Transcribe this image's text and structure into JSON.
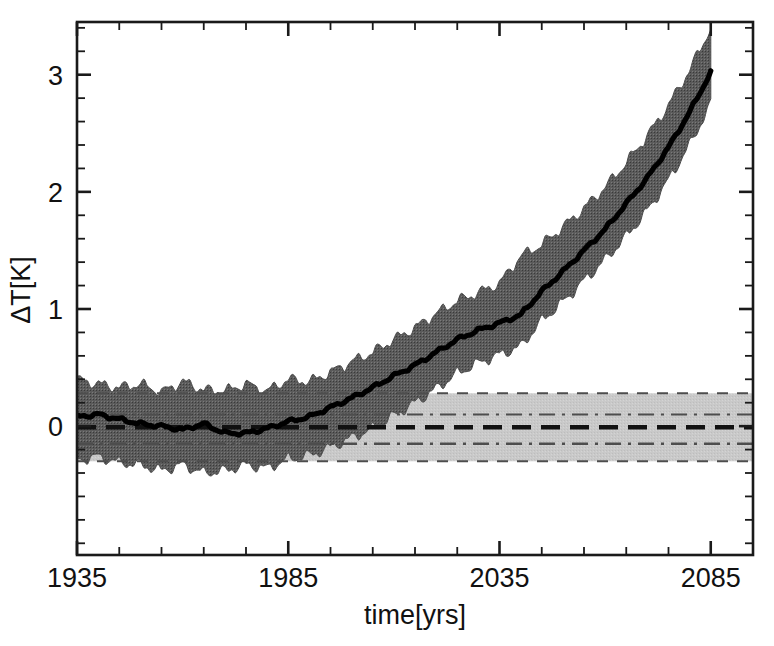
{
  "chart_data": {
    "type": "line",
    "title": "",
    "xlabel": "time[yrs]",
    "ylabel": "ΔT[K]",
    "xlim": [
      1935,
      2095
    ],
    "ylim": [
      -1.1,
      3.45
    ],
    "xticks": [
      1935,
      1985,
      2035,
      2085
    ],
    "xticklabels": [
      "1935",
      "1985",
      "2035",
      "2085"
    ],
    "yticks": [
      0,
      1,
      2,
      3
    ],
    "yticklabels": [
      "0",
      "1",
      "2",
      "3"
    ],
    "x_minor_tick_interval": 10,
    "y_minor_tick_interval": 0.2,
    "grid": false,
    "legend": null,
    "annotations": [],
    "series": [
      {
        "name": "ensemble mean ΔT",
        "style": "solid-thick-black",
        "color": "#000000",
        "x": [
          1935,
          1940,
          1945,
          1950,
          1955,
          1960,
          1965,
          1970,
          1975,
          1980,
          1985,
          1990,
          1995,
          2000,
          2005,
          2010,
          2015,
          2020,
          2025,
          2030,
          2035,
          2040,
          2045,
          2050,
          2055,
          2060,
          2065,
          2070,
          2075,
          2080,
          2085
        ],
        "values": [
          0.08,
          0.1,
          0.06,
          0.02,
          0.0,
          -0.03,
          0.02,
          -0.06,
          -0.06,
          -0.02,
          0.04,
          0.08,
          0.16,
          0.24,
          0.33,
          0.43,
          0.52,
          0.63,
          0.74,
          0.82,
          0.88,
          0.95,
          1.15,
          1.32,
          1.5,
          1.68,
          1.9,
          2.12,
          2.38,
          2.68,
          3.02
        ]
      },
      {
        "name": "ensemble envelope upper",
        "style": "dark-band-edge",
        "color": "#595959",
        "x": [
          1935,
          1940,
          1945,
          1950,
          1955,
          1960,
          1965,
          1970,
          1975,
          1980,
          1985,
          1990,
          1995,
          2000,
          2005,
          2010,
          2015,
          2020,
          2025,
          2030,
          2035,
          2040,
          2045,
          2050,
          2055,
          2060,
          2065,
          2070,
          2075,
          2080,
          2085
        ],
        "values": [
          0.4,
          0.36,
          0.33,
          0.36,
          0.29,
          0.38,
          0.31,
          0.3,
          0.36,
          0.3,
          0.4,
          0.38,
          0.46,
          0.55,
          0.63,
          0.74,
          0.84,
          0.96,
          1.07,
          1.14,
          1.22,
          1.45,
          1.55,
          1.7,
          1.86,
          2.04,
          2.25,
          2.48,
          2.74,
          3.04,
          3.4
        ]
      },
      {
        "name": "ensemble envelope lower",
        "style": "dark-band-edge",
        "color": "#595959",
        "x": [
          1935,
          1940,
          1945,
          1950,
          1955,
          1960,
          1965,
          1970,
          1975,
          1980,
          1985,
          1990,
          1995,
          2000,
          2005,
          2010,
          2015,
          2020,
          2025,
          2030,
          2035,
          2040,
          2045,
          2050,
          2055,
          2060,
          2065,
          2070,
          2075,
          2080,
          2085
        ],
        "values": [
          -0.29,
          -0.26,
          -0.31,
          -0.33,
          -0.38,
          -0.33,
          -0.4,
          -0.38,
          -0.33,
          -0.36,
          -0.28,
          -0.25,
          -0.18,
          -0.1,
          -0.02,
          0.09,
          0.2,
          0.32,
          0.45,
          0.54,
          0.61,
          0.68,
          0.9,
          1.06,
          1.24,
          1.42,
          1.62,
          1.84,
          2.1,
          2.4,
          2.75
        ]
      }
    ],
    "reference_band": {
      "name": "natural variability band",
      "fill_color": "#c9c9c9",
      "x_range": [
        1935,
        2095
      ],
      "outer_upper": 0.28,
      "outer_lower": -0.3,
      "inner_upper": 0.1,
      "inner_lower": -0.15,
      "center": -0.01,
      "center_style": "thick-dashed-black",
      "inner_style": "dash-dot-thin",
      "outer_style": "dashed-thin"
    }
  },
  "axes": {
    "x_axis_title": "time[yrs]",
    "y_axis_title": "ΔT[K]"
  }
}
